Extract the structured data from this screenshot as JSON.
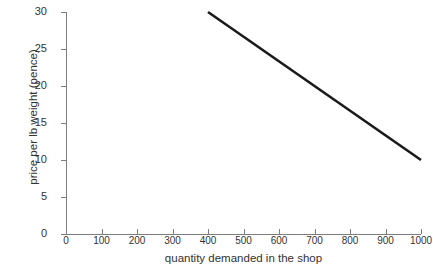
{
  "chart_data": {
    "type": "line",
    "title": "",
    "subtitle": "",
    "xlabel": "quantity demanded in the shop",
    "ylabel": "price per lb weight (pence)",
    "xlim": [
      0,
      1000
    ],
    "ylim": [
      0,
      30
    ],
    "xticks": [
      0,
      100,
      200,
      300,
      400,
      500,
      600,
      700,
      800,
      900,
      1000
    ],
    "xtick_labels": [
      "0",
      "100",
      "200",
      "300",
      "400",
      "500",
      "600",
      "700",
      "800",
      "900",
      "1000"
    ],
    "yticks": [
      0,
      5,
      10,
      15,
      20,
      25,
      30
    ],
    "ytick_labels": [
      "0",
      "5",
      "10",
      "15",
      "20",
      "25",
      "30"
    ],
    "grid": false,
    "legend": false,
    "legend_position": "none",
    "series": [
      {
        "name": "demand curve",
        "color": "#1a1a1a",
        "line_width": 2.6,
        "x": [
          400,
          1000
        ],
        "values": [
          30,
          10
        ],
        "points": [
          {
            "x": 400,
            "y": 30
          },
          {
            "x": 1000,
            "y": 10
          }
        ]
      }
    ],
    "annotations": [],
    "axis_color": "#7d7d7d",
    "background_color": "#ffffff",
    "text_color": "#333333"
  }
}
